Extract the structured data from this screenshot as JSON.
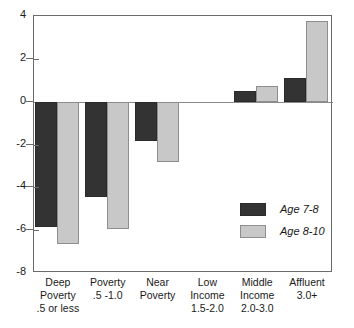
{
  "chart_data": {
    "type": "bar",
    "title": "",
    "subtitle": "",
    "xlabel": "",
    "ylabel": "",
    "ylim": [
      -8,
      4
    ],
    "yticks": [
      4,
      2,
      0,
      -2,
      -4,
      -6,
      -8
    ],
    "ytick_labels": [
      "4",
      "2",
      "0",
      "-2",
      "-4",
      "-6",
      "-8"
    ],
    "grid": false,
    "legend_position": "inside-right",
    "zero_line": true,
    "categories": [
      "Deep Poverty .5 or less",
      "Poverty .5 -1.0",
      "Near Poverty",
      "Low Income 1.5-2.0",
      "Middle Income 2.0-3.0",
      "Affluent 3.0+"
    ],
    "category_lines": [
      [
        "Deep",
        "Poverty",
        ".5 or less"
      ],
      [
        "Poverty",
        ".5 -1.0",
        ""
      ],
      [
        "Near",
        "Poverty",
        ""
      ],
      [
        "Low",
        "Income",
        "1.5-2.0"
      ],
      [
        "Middle",
        "Income",
        "2.0-3.0"
      ],
      [
        "Affluent",
        "3.0+",
        ""
      ]
    ],
    "series": [
      {
        "name": "Age 7-8",
        "color": "#333333",
        "values": [
          -5.85,
          -4.45,
          -1.85,
          0,
          0.5,
          1.1
        ]
      },
      {
        "name": "Age 8-10",
        "color": "#c8c8c8",
        "values": [
          -6.65,
          -5.95,
          -2.8,
          0,
          0.75,
          3.75
        ]
      }
    ]
  },
  "legend": {
    "items": [
      {
        "label": "Age 7-8",
        "swatch": "dark"
      },
      {
        "label": "Age 8-10",
        "swatch": "light"
      }
    ]
  },
  "colors": {
    "series_dark": "#333333",
    "series_light": "#c8c8c8",
    "axis": "#6b6b6b",
    "background": "#ffffff",
    "text": "#1a1a1a"
  }
}
